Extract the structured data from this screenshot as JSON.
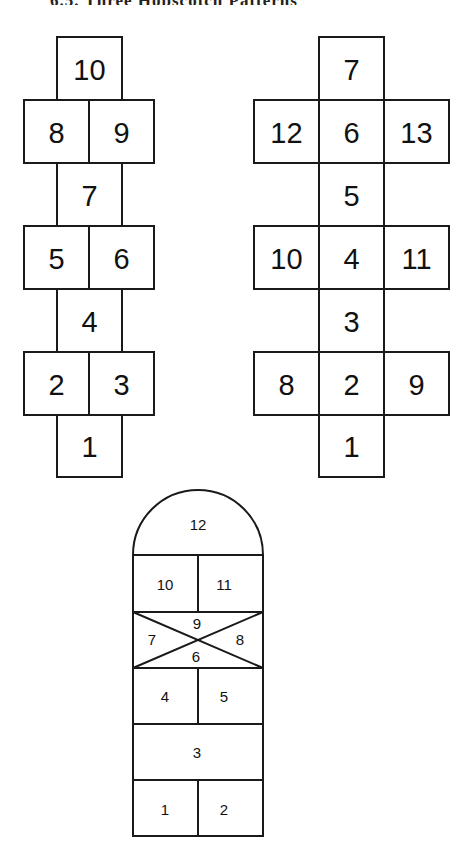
{
  "header": {
    "title_clipped": "6.5. Three Hopscotch Patterns"
  },
  "diagram_left": {
    "name": "Classic hopscotch",
    "cells": [
      {
        "label": "10",
        "x": 57,
        "y": 37,
        "w": 65,
        "h": 63
      },
      {
        "label": "8",
        "x": 24,
        "y": 100,
        "w": 65,
        "h": 63
      },
      {
        "label": "9",
        "x": 89,
        "y": 100,
        "w": 65,
        "h": 63
      },
      {
        "label": "7",
        "x": 57,
        "y": 163,
        "w": 65,
        "h": 63
      },
      {
        "label": "5",
        "x": 24,
        "y": 226,
        "w": 65,
        "h": 63
      },
      {
        "label": "6",
        "x": 89,
        "y": 226,
        "w": 65,
        "h": 63
      },
      {
        "label": "4",
        "x": 57,
        "y": 289,
        "w": 65,
        "h": 63
      },
      {
        "label": "2",
        "x": 24,
        "y": 352,
        "w": 65,
        "h": 63
      },
      {
        "label": "3",
        "x": 89,
        "y": 352,
        "w": 65,
        "h": 63
      },
      {
        "label": "1",
        "x": 57,
        "y": 415,
        "w": 65,
        "h": 62
      }
    ]
  },
  "diagram_right": {
    "name": "Cross hopscotch",
    "cells": [
      {
        "label": "7",
        "x": 319,
        "y": 37,
        "w": 65,
        "h": 63
      },
      {
        "label": "12",
        "x": 254,
        "y": 100,
        "w": 65,
        "h": 63
      },
      {
        "label": "6",
        "x": 319,
        "y": 100,
        "w": 65,
        "h": 63
      },
      {
        "label": "13",
        "x": 384,
        "y": 100,
        "w": 65,
        "h": 63
      },
      {
        "label": "5",
        "x": 319,
        "y": 163,
        "w": 65,
        "h": 63
      },
      {
        "label": "10",
        "x": 254,
        "y": 226,
        "w": 65,
        "h": 63
      },
      {
        "label": "4",
        "x": 319,
        "y": 226,
        "w": 65,
        "h": 63
      },
      {
        "label": "11",
        "x": 384,
        "y": 226,
        "w": 65,
        "h": 63
      },
      {
        "label": "3",
        "x": 319,
        "y": 289,
        "w": 65,
        "h": 63
      },
      {
        "label": "8",
        "x": 254,
        "y": 352,
        "w": 65,
        "h": 63
      },
      {
        "label": "2",
        "x": 319,
        "y": 352,
        "w": 65,
        "h": 63
      },
      {
        "label": "9",
        "x": 384,
        "y": 352,
        "w": 65,
        "h": 63
      },
      {
        "label": "1",
        "x": 319,
        "y": 415,
        "w": 65,
        "h": 62
      }
    ]
  },
  "diagram_bottom": {
    "name": "Dome hopscotch",
    "dome_label": "12",
    "labels": {
      "c10": "10",
      "c11": "11",
      "x9": "9",
      "x7": "7",
      "x8": "8",
      "x6": "6",
      "c4": "4",
      "c5": "5",
      "c3": "3",
      "c1": "1",
      "c2": "2"
    }
  }
}
